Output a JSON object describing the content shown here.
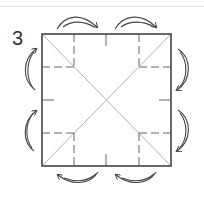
{
  "diagram": {
    "step_number": "3",
    "colors": {
      "outline": "#444444",
      "crease": "#a8a8a8",
      "dash": "#666666",
      "arrow": "#444444",
      "rule": "#e4e4e4"
    },
    "square": {
      "x": 42,
      "y": 34,
      "width": 129,
      "height": 132
    },
    "arrow_pairs": [
      {
        "side": "top",
        "position": "left-quarter"
      },
      {
        "side": "top",
        "position": "right-quarter"
      },
      {
        "side": "right",
        "position": "upper-quarter"
      },
      {
        "side": "right",
        "position": "lower-quarter"
      },
      {
        "side": "bottom",
        "position": "right-quarter"
      },
      {
        "side": "bottom",
        "position": "left-quarter"
      },
      {
        "side": "left",
        "position": "lower-quarter"
      },
      {
        "side": "left",
        "position": "upper-quarter"
      }
    ]
  }
}
